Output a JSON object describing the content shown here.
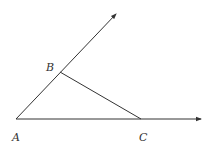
{
  "diagram": {
    "type": "geometry",
    "points": {
      "A": {
        "label": "A",
        "x": 16,
        "y": 119
      },
      "B": {
        "label": "B",
        "x": 60,
        "y": 72
      },
      "C": {
        "label": "C",
        "x": 141,
        "y": 119
      }
    },
    "rays": [
      {
        "from": "A",
        "through": "B",
        "tip": {
          "x": 116,
          "y": 14
        }
      },
      {
        "from": "A",
        "through": "C",
        "tip": {
          "x": 201,
          "y": 119
        }
      }
    ],
    "segments": [
      {
        "from": "B",
        "to": "C"
      }
    ],
    "colors": {
      "line": "#333333",
      "background": "#ffffff"
    }
  }
}
